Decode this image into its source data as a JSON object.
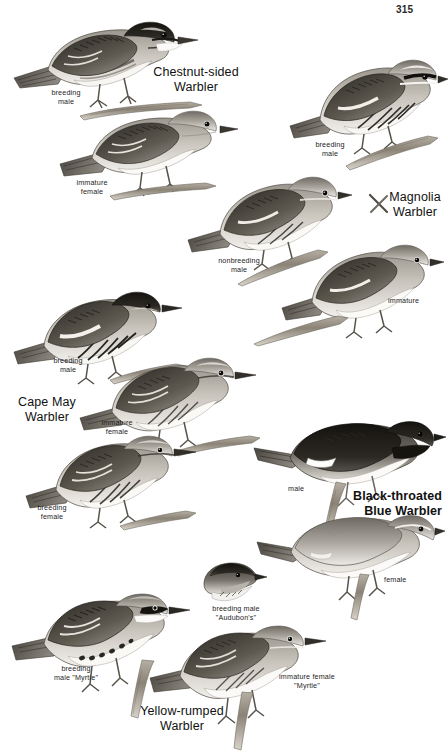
{
  "page": {
    "number": "315",
    "background_color": "#ffffff",
    "ink_color": "#1a1a1a",
    "kind": "field-guide-plate"
  },
  "species": [
    {
      "id": "chestnut-sided-warbler",
      "name_line1": "Chestnut-sided",
      "name_line2": "Warbler",
      "plumages": [
        "breeding male",
        "immature female"
      ]
    },
    {
      "id": "magnolia-warbler",
      "name_line1": "Magnolia",
      "name_line2": "Warbler",
      "plumages": [
        "breeding male",
        "nonbreeding male",
        "immature"
      ]
    },
    {
      "id": "cape-may-warbler",
      "name_line1": "Cape May",
      "name_line2": "Warbler",
      "plumages": [
        "breeding male",
        "immature female",
        "breeding female"
      ]
    },
    {
      "id": "black-throated-blue-warbler",
      "name_line1": "Black-throated",
      "name_line2": "Blue Warbler",
      "plumages": [
        "male",
        "female"
      ]
    },
    {
      "id": "yellow-rumped-warbler",
      "name_line1": "Yellow-rumped",
      "name_line2": "Warbler",
      "plumages": [
        "breeding male \"Audubon's\"",
        "breeding male \"Myrtle\"",
        "immature female \"Myrtle\""
      ]
    }
  ],
  "labels": {
    "chestnut_breeding_male_l1": "breeding",
    "chestnut_breeding_male_l2": "male",
    "chestnut_immature_female_l1": "immature",
    "chestnut_immature_female_l2": "female",
    "magnolia_breeding_male_l1": "breeding",
    "magnolia_breeding_male_l2": "male",
    "magnolia_nonbreeding_male_l1": "nonbreeding",
    "magnolia_nonbreeding_male_l2": "male",
    "magnolia_immature": "immature",
    "capemay_breeding_male_l1": "breeding",
    "capemay_breeding_male_l2": "male",
    "capemay_immature_female_l1": "immature",
    "capemay_immature_female_l2": "female",
    "capemay_breeding_female_l1": "breeding",
    "capemay_breeding_female_l2": "female",
    "btblue_male": "male",
    "btblue_female": "female",
    "audubons_l1": "breeding male",
    "audubons_l2": "\"Audubon's\"",
    "myrtle_male_l1": "breeding",
    "myrtle_male_l2": "male \"Myrtle\"",
    "myrtle_immature_l1": "immature female",
    "myrtle_immature_l2": "\"Myrtle\""
  },
  "titles": {
    "chestnut_l1": "Chestnut-sided",
    "chestnut_l2": "Warbler",
    "magnolia_l1": "Magnolia",
    "magnolia_l2": "Warbler",
    "capemay_l1": "Cape May",
    "capemay_l2": "Warbler",
    "btblue_l1": "Black-throated",
    "btblue_l2": "Blue Warbler",
    "yellowrumped_l1": "Yellow-rumped",
    "yellowrumped_l2": "Warbler"
  }
}
